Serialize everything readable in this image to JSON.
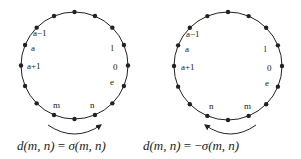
{
  "diagram": {
    "colors": {
      "stroke": "#222222",
      "background": "#ffffff"
    },
    "panels": [
      {
        "id": "left",
        "circle": {
          "cx": 74.5,
          "cy": 65.5,
          "r": 53.5,
          "dot_count": 16
        },
        "labels": [
          {
            "text": "a−1",
            "x": 33,
            "y": 36
          },
          {
            "text": "a",
            "x": 31,
            "y": 51
          },
          {
            "text": "a+1",
            "x": 27,
            "y": 69
          },
          {
            "text": "l",
            "x": 111,
            "y": 51
          },
          {
            "text": "0",
            "x": 113,
            "y": 70
          },
          {
            "text": "e",
            "x": 110,
            "y": 85
          },
          {
            "text": "m",
            "x": 53,
            "y": 108
          },
          {
            "text": "n",
            "x": 90,
            "y": 108
          }
        ],
        "arrow": {
          "direction": "clockwise",
          "from_x": 48,
          "to_x": 101,
          "y": 125,
          "sag": 9
        },
        "formula": {
          "prefix": "d",
          "args": "(m, n)",
          "eq": " = ",
          "sign": "",
          "fn": "σ",
          "fn_args": "(m, n)",
          "x": 17,
          "y": 150
        }
      },
      {
        "id": "right",
        "circle": {
          "cx": 228,
          "cy": 66,
          "r": 54,
          "dot_count": 16
        },
        "labels": [
          {
            "text": "a−1",
            "x": 186,
            "y": 37
          },
          {
            "text": "a",
            "x": 185,
            "y": 52
          },
          {
            "text": "a+1",
            "x": 181,
            "y": 70
          },
          {
            "text": "l",
            "x": 264,
            "y": 52
          },
          {
            "text": "0",
            "x": 267,
            "y": 71
          },
          {
            "text": "e",
            "x": 265,
            "y": 86
          },
          {
            "text": "n",
            "x": 209,
            "y": 109
          },
          {
            "text": "m",
            "x": 244,
            "y": 109
          }
        ],
        "arrow": {
          "direction": "counterclockwise",
          "from_x": 256,
          "to_x": 205,
          "y": 125,
          "sag": 9
        },
        "formula": {
          "prefix": "d",
          "args": "(m, n)",
          "eq": " = ",
          "sign": "−",
          "fn": "σ",
          "fn_args": "(m, n)",
          "x": 143,
          "y": 150
        }
      }
    ]
  }
}
